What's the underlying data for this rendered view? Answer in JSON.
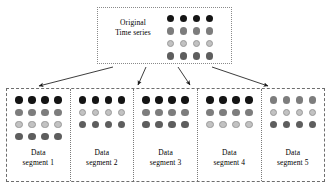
{
  "figure": {
    "type": "segmentation-diagram",
    "palette": {
      "black": "#141414",
      "gray": "#7d7d7d",
      "light": "#c2c2c2",
      "dark_gray": "#5e5e5e",
      "box_border": "#8a8a8a",
      "outer_border": "#6d6d6d",
      "separator": "#7a7a7a",
      "arrow": "#1a1a1a",
      "background": "#ffffff"
    }
  },
  "source": {
    "label_line1": "Original",
    "label_line2": "Time series",
    "columns": 4,
    "rows": [
      "black",
      "gray",
      "light",
      "dark-gray"
    ]
  },
  "arrows": {
    "count": 4,
    "direction": "down",
    "style": "solid-line-with-filled-head",
    "targets": [
      "segment 1",
      "segment 3",
      "segment 4",
      "segment 5"
    ]
  },
  "segments": [
    {
      "label_line1": "Data",
      "label_line2": "segment 1",
      "columns": 4,
      "rows": [
        "black",
        "gray",
        "light",
        "dark-gray"
      ],
      "width_px": 64
    },
    {
      "label_line1": "Data",
      "label_line2": "segment 2",
      "columns": 4,
      "rows": [
        "black",
        "light",
        "dark-gray"
      ],
      "width_px": 62
    },
    {
      "label_line1": "Data",
      "label_line2": "segment 3",
      "columns": 4,
      "rows": [
        "black",
        "gray",
        "dark-gray"
      ],
      "width_px": 66
    },
    {
      "label_line1": "Data",
      "label_line2": "segment 4",
      "columns": 4,
      "rows": [
        "black",
        "gray",
        "light"
      ],
      "width_px": 63
    },
    {
      "label_line1": "Data",
      "label_line2": "segment 5",
      "columns": 4,
      "rows": [
        "gray",
        "light",
        "dark-gray"
      ],
      "width_px": 62
    }
  ]
}
